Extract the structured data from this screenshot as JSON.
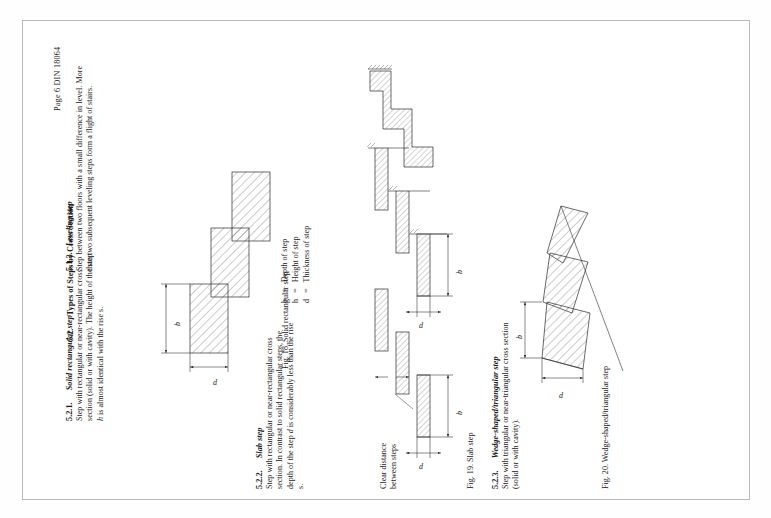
{
  "document": {
    "header": "Page 6 DIN 18064",
    "standard": "DIN 18064",
    "page_number": "Page 6"
  },
  "sections": [
    {
      "number": "5.1.3.",
      "title": "Leveling step",
      "body": "Step between two floors with a small difference in level. More than two subsequent leveling steps form a flight of stairs."
    },
    {
      "number": "5.2.",
      "title": "Types of Steps by Cross Section",
      "body": ""
    },
    {
      "number": "5.2.1.",
      "title": "Solid rectangular step",
      "body_line1": "Step with rectangular or near-rectangular cross",
      "body_line2": "section (solid or with cavity). The height of the step",
      "body_line3_italic": "h",
      "body_line3": " is almost identical with the rise s."
    },
    {
      "number": "5.2.2.",
      "title": "Slab step",
      "body_line1": "Step with rectangular or near-rectangular cross",
      "body_line2": "section. In contrast to solid rectangular steps, the",
      "body_line3a": "depth of the step ",
      "body_line3_italic": "d",
      "body_line3b": " is considerably less than the rise",
      "body_line4": "s."
    },
    {
      "number": "5.2.3.",
      "title": "Wedge-shaped/triangular step",
      "body_line1": "Step with triangular or near-triangular cross section",
      "body_line2": "(solid or with cavity)."
    }
  ],
  "legend": {
    "items": [
      {
        "symbol": "b",
        "equals": "=",
        "meaning": "Depth of step"
      },
      {
        "symbol": "h",
        "equals": "=",
        "meaning": "Height of step"
      },
      {
        "symbol": "d",
        "equals": "=",
        "meaning": "Thickness of step"
      }
    ]
  },
  "figures": [
    {
      "id": "fig18",
      "caption": "Fig. 18. Solid rectangular step",
      "dimensions": [
        "b",
        "d"
      ]
    },
    {
      "id": "fig19",
      "caption": "Fig. 19. Slab step",
      "dimensions": [
        "b",
        "d"
      ],
      "annotation": {
        "line1": "Clear distance",
        "line2": "between steps"
      }
    },
    {
      "id": "fig20",
      "caption": "Fig. 20. Wedge-shaped/triangular step",
      "dimensions": [
        "b",
        "d"
      ]
    }
  ],
  "colors": {
    "page_background": "#ffffff",
    "scan_background": "#fefefe",
    "border": "#b9b9b9",
    "ink": "#1a1a1a",
    "line": "#2b2b2b"
  }
}
